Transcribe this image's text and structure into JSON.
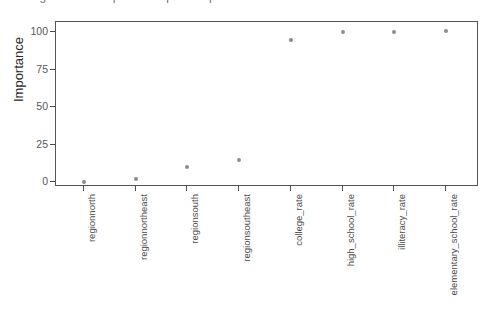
{
  "artifacts": {
    "top_sliver_text": "regression / importance plot output"
  },
  "chart_data": {
    "type": "scatter",
    "title": "",
    "subtitle": "",
    "xlabel": "",
    "ylabel": "Importance",
    "categories": [
      "regionnorth",
      "regionnortheast",
      "regionsouth",
      "regionsoutheast",
      "college_rate",
      "high_school_rate",
      "illiteracy_rate",
      "elementary_school_rate"
    ],
    "values": [
      0,
      2,
      10,
      15,
      95,
      100,
      100,
      101
    ],
    "ylim": [
      0,
      101
    ],
    "yticks": [
      0,
      25,
      50,
      75,
      100
    ],
    "ytick_labels": [
      "0",
      "25",
      "50",
      "75",
      "100"
    ],
    "grid": false,
    "legend": "none",
    "point_color": "#8c8c8c",
    "panel_border_color": "#545454",
    "background_color": "#ffffff"
  }
}
